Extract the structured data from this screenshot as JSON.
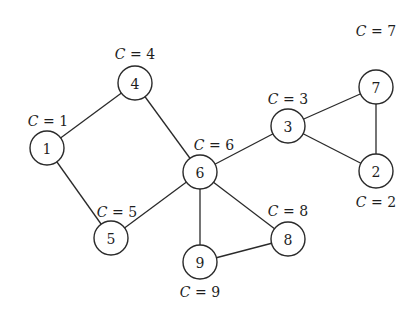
{
  "diagram": {
    "type": "undirected-graph",
    "nodes": [
      {
        "id": "1",
        "label": "1",
        "x": 47,
        "y": 148,
        "c_label": "C = 1",
        "c_var": "C",
        "c_val": "= 1",
        "cx": 48,
        "cy": 126
      },
      {
        "id": "2",
        "label": "2",
        "x": 376,
        "y": 171,
        "c_label": "C = 2",
        "c_var": "C",
        "c_val": "= 2",
        "cx": 376,
        "cy": 207
      },
      {
        "id": "3",
        "label": "3",
        "x": 288,
        "y": 126,
        "c_label": "C = 3",
        "c_var": "C",
        "c_val": "= 3",
        "cx": 288,
        "cy": 104
      },
      {
        "id": "4",
        "label": "4",
        "x": 135,
        "y": 83,
        "c_label": "C = 4",
        "c_var": "C",
        "c_val": "= 4",
        "cx": 135,
        "cy": 59
      },
      {
        "id": "5",
        "label": "5",
        "x": 111,
        "y": 238,
        "c_label": "C = 5",
        "c_var": "C",
        "c_val": "= 5",
        "cx": 117,
        "cy": 217
      },
      {
        "id": "6",
        "label": "6",
        "x": 200,
        "y": 172,
        "c_label": "C = 6",
        "c_var": "C",
        "c_val": "= 6",
        "cx": 214,
        "cy": 150
      },
      {
        "id": "7",
        "label": "7",
        "x": 376,
        "y": 87,
        "c_label": "C = 7",
        "c_var": "C",
        "c_val": "= 7",
        "cx": 376,
        "cy": 36
      },
      {
        "id": "8",
        "label": "8",
        "x": 288,
        "y": 239,
        "c_label": "C = 8",
        "c_var": "C",
        "c_val": "= 8",
        "cx": 288,
        "cy": 216
      },
      {
        "id": "9",
        "label": "9",
        "x": 200,
        "y": 262,
        "c_label": "C = 9",
        "c_var": "C",
        "c_val": "= 9",
        "cx": 200,
        "cy": 297
      }
    ],
    "edges": [
      [
        "1",
        "4"
      ],
      [
        "1",
        "5"
      ],
      [
        "4",
        "6"
      ],
      [
        "5",
        "6"
      ],
      [
        "6",
        "3"
      ],
      [
        "6",
        "9"
      ],
      [
        "6",
        "8"
      ],
      [
        "9",
        "8"
      ],
      [
        "3",
        "7"
      ],
      [
        "3",
        "2"
      ],
      [
        "7",
        "2"
      ]
    ],
    "node_radius": 17
  }
}
